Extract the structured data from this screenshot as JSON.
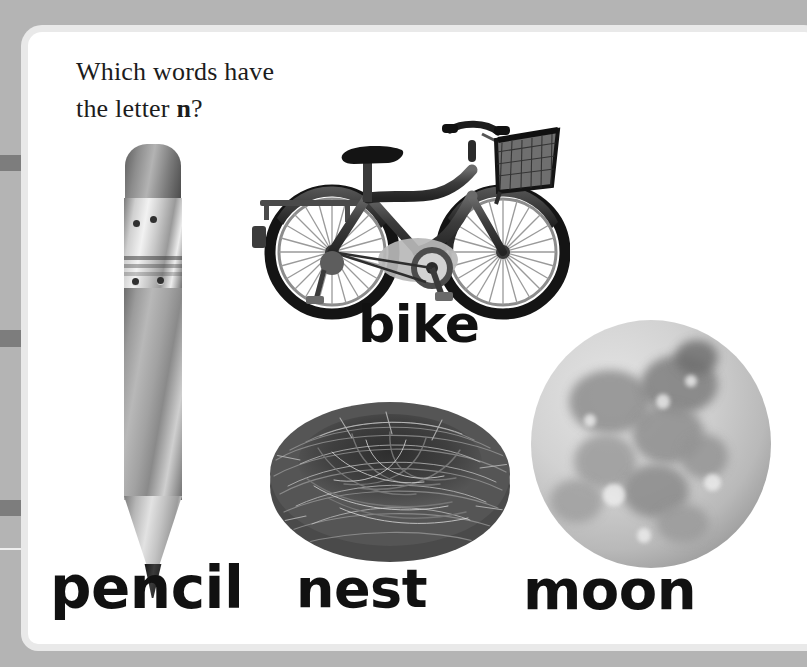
{
  "page": {
    "background_color": "#b4b4b4",
    "card_color": "#ffffff",
    "card_edge_color": "#e9e9e9",
    "gutter_mark_color": "#7d7d7d"
  },
  "prompt": {
    "line1": "Which words have",
    "line2_before": "the letter ",
    "line2_bold": "n",
    "line2_after": "?",
    "full_text": "Which words have the letter n?",
    "target_letter": "n",
    "text_color": "#1c1c1c"
  },
  "items": [
    {
      "id": "pencil",
      "label": "pencil",
      "icon": "pencil-photo",
      "has_target_letter": true
    },
    {
      "id": "bike",
      "label": "bike",
      "icon": "bicycle-photo",
      "has_target_letter": false
    },
    {
      "id": "nest",
      "label": "nest",
      "icon": "birds-nest-photo",
      "has_target_letter": true
    },
    {
      "id": "moon",
      "label": "moon",
      "icon": "full-moon-photo",
      "has_target_letter": true
    }
  ],
  "label_color": "#111111"
}
